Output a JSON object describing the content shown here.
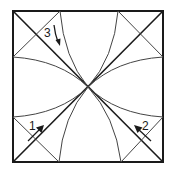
{
  "diagram": {
    "labels": [
      {
        "id": "label-3",
        "text": "3",
        "position": "top-left",
        "arrow": "down"
      },
      {
        "id": "label-1",
        "text": "1",
        "position": "bottom-left",
        "arrow": "up-right"
      },
      {
        "id": "label-2",
        "text": "2",
        "position": "bottom-right",
        "arrow": "up-left"
      }
    ],
    "colors": {
      "line": "#1a1a1a",
      "thin_line": "#444444",
      "background": "#ffffff"
    }
  }
}
